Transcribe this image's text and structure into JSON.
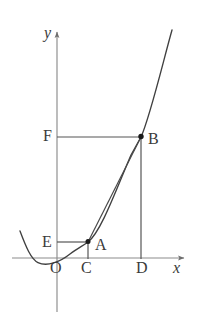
{
  "figure": {
    "type": "geometry-diagram",
    "background_color": "#ffffff",
    "axis_color": "#8c8c8c",
    "curve_color": "#404040",
    "chord_color": "#4a4a4a",
    "helper_line_color": "#6e6e6e",
    "label_color": "#3a3a3a",
    "point_color": "#1a1a1a"
  },
  "axes": {
    "x_axis": {
      "label": "x",
      "label_style": "italic",
      "arrow": "right",
      "y_pixel": 258,
      "x_start": 12,
      "x_end": 188
    },
    "y_axis": {
      "label": "y",
      "label_style": "italic",
      "arrow": "up",
      "x_pixel": 57,
      "y_start": 28,
      "y_end": 312
    },
    "origin_label": "O"
  },
  "points": [
    {
      "name": "A",
      "label": "A",
      "x": 88,
      "y": 242,
      "dot": true,
      "label_dx": 9,
      "label_dy": 2
    },
    {
      "name": "B",
      "label": "B",
      "x": 141,
      "y": 137,
      "dot": true,
      "label_dx": 9,
      "label_dy": 2
    },
    {
      "name": "C",
      "label": "C",
      "x": 88,
      "y": 258,
      "dot": false,
      "label_dx": -4,
      "label_dy": 16
    },
    {
      "name": "D",
      "label": "D",
      "x": 141,
      "y": 258,
      "dot": false,
      "label_dx": -4,
      "label_dy": 16
    },
    {
      "name": "E",
      "label": "E",
      "x": 57,
      "y": 242,
      "dot": false,
      "label_dx": -13,
      "label_dy": 2
    },
    {
      "name": "F",
      "label": "F",
      "x": 57,
      "y": 137,
      "dot": false,
      "label_dx": -13,
      "label_dy": 2
    },
    {
      "name": "O",
      "label": "O",
      "x": 57,
      "y": 258,
      "dot": false,
      "label_dx": -4,
      "label_dy": 16
    }
  ],
  "segments": [
    {
      "name": "segment-EA",
      "from": "E",
      "to": "A",
      "orientation": "horizontal"
    },
    {
      "name": "segment-FB",
      "from": "F",
      "to": "B",
      "orientation": "horizontal"
    },
    {
      "name": "segment-AC",
      "from": "A",
      "to": "C",
      "orientation": "vertical"
    },
    {
      "name": "segment-BD",
      "from": "B",
      "to": "D",
      "orientation": "vertical"
    },
    {
      "name": "chord-AB",
      "from": "A",
      "to": "B",
      "orientation": "oblique"
    }
  ],
  "curve": {
    "name": "parabola",
    "type": "parabola",
    "opens": "up",
    "vertex_pixel": {
      "x": 38,
      "y": 263
    },
    "passes_through": [
      "A",
      "B"
    ],
    "left_end_pixel": {
      "x": 20,
      "y": 232
    },
    "right_end_pixel": {
      "x": 172,
      "y": 30
    }
  },
  "labels": {
    "x_axis": "x",
    "y_axis": "y",
    "origin": "O",
    "point_a": "A",
    "point_b": "B",
    "point_c": "C",
    "point_d": "D",
    "point_e": "E",
    "point_f": "F"
  }
}
